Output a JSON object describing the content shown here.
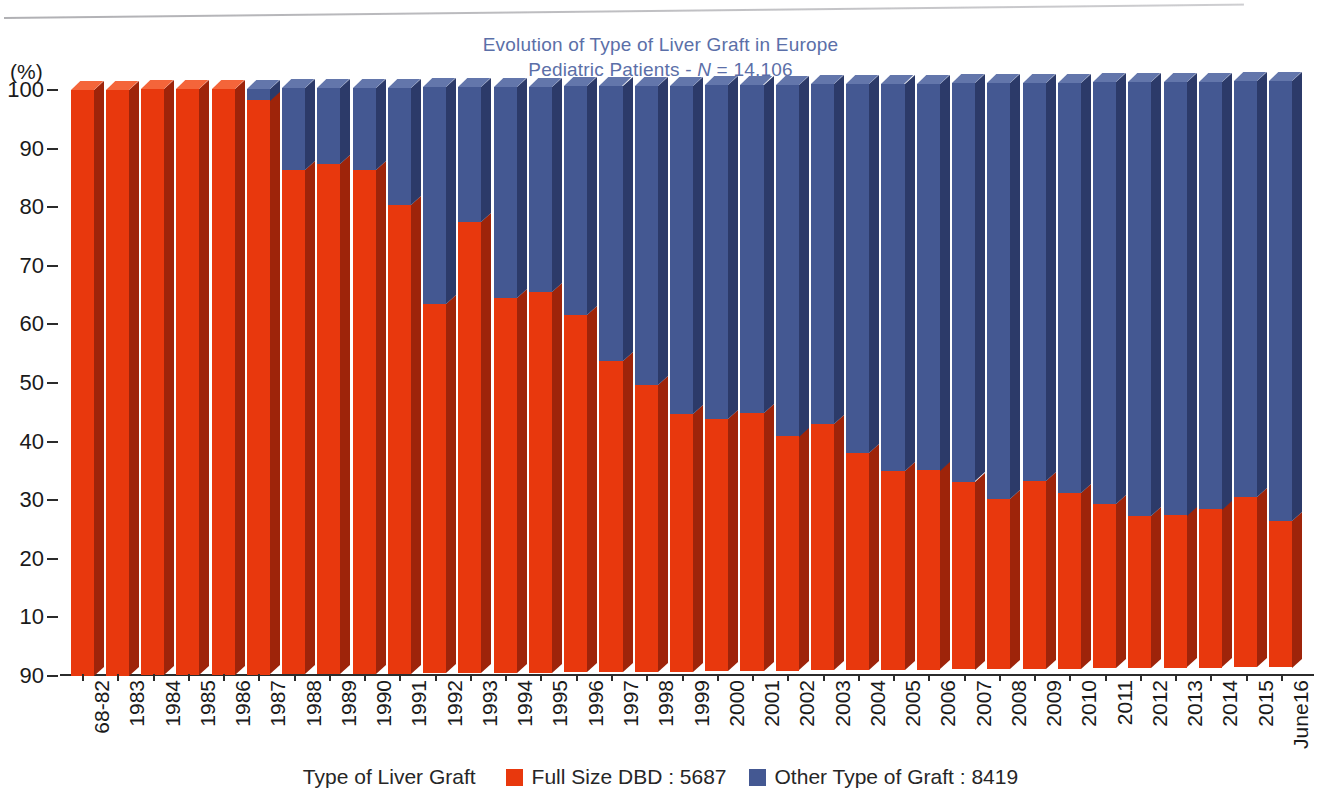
{
  "title": {
    "line1": "Evolution of Type of Liver Graft in Europe",
    "line2_prefix": "Pediatric Patients - ",
    "line2_italic": "N",
    "line2_suffix": " = 14,106",
    "color": "#5b6fa8"
  },
  "axes": {
    "y_unit": "(%)",
    "y_ticks": [
      "100",
      "90",
      "80",
      "70",
      "60",
      "50",
      "40",
      "30",
      "20",
      "10",
      "90"
    ],
    "y_min": 0,
    "y_max": 100
  },
  "legend": {
    "caption": "Type of Liver Graft",
    "entries": [
      {
        "label": "Full Size DBD : 5687",
        "color": "#e8380d"
      },
      {
        "label": "Other Type of Graft : 8419",
        "color": "#445892"
      }
    ]
  },
  "chart_data": {
    "type": "bar",
    "subtype": "stacked-100-percent-3d",
    "xlabel": "",
    "ylabel": "(%)",
    "ylim": [
      0,
      100
    ],
    "grid": false,
    "legend_position": "bottom-center",
    "categories": [
      "68-82",
      "1983",
      "1984",
      "1985",
      "1986",
      "1987",
      "1988",
      "1989",
      "1990",
      "1991",
      "1992",
      "1993",
      "1994",
      "1995",
      "1996",
      "1997",
      "1998",
      "1999",
      "2000",
      "2001",
      "2002",
      "2003",
      "2004",
      "2005",
      "2006",
      "2007",
      "2008",
      "2009",
      "2010",
      "2011",
      "2012",
      "2013",
      "2014",
      "2015",
      "June16"
    ],
    "series": [
      {
        "name": "Full Size DBD : 5687",
        "color": "#e8380d",
        "total": 5687,
        "values": [
          100,
          100,
          100,
          100,
          100,
          98,
          86,
          87,
          86,
          80,
          63,
          77,
          64,
          65,
          61,
          53,
          49,
          44,
          43,
          44,
          40,
          42,
          37,
          34,
          34,
          32,
          29,
          32,
          30,
          28,
          26,
          26,
          27,
          29,
          25
        ]
      },
      {
        "name": "Other Type of Graft : 8419",
        "color": "#445892",
        "total": 8419,
        "values": [
          0,
          0,
          0,
          0,
          0,
          2,
          14,
          13,
          14,
          20,
          37,
          23,
          36,
          35,
          39,
          47,
          51,
          56,
          57,
          56,
          60,
          58,
          63,
          66,
          66,
          68,
          71,
          68,
          70,
          72,
          74,
          74,
          73,
          71,
          75
        ]
      }
    ]
  }
}
